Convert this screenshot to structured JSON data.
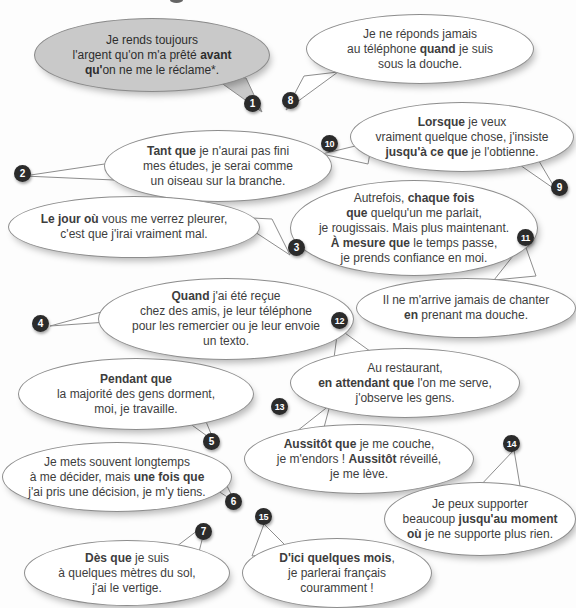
{
  "page": {
    "background_color": "#fdfdfd",
    "badge_color": "#2b2b2b",
    "bubble_fill": "#ffffff",
    "bubble_highlight_fill": "#c9c9c9",
    "bubble_stroke": "#8d8d8d"
  },
  "bubbles": [
    {
      "number": "1",
      "style": "gray",
      "lines": [
        [
          {
            "t": "Je rends toujours",
            "b": false
          }
        ],
        [
          {
            "t": "l'argent qu'on m'a prêté ",
            "b": false
          },
          {
            "t": "avant",
            "b": true
          }
        ],
        [
          {
            "t": "qu'",
            "b": true
          },
          {
            "t": "on ne me le réclame*.",
            "b": false
          }
        ]
      ]
    },
    {
      "number": "2",
      "style": "plain",
      "lines": [
        [
          {
            "t": "Tant que",
            "b": true
          },
          {
            "t": " je n'aurai pas fini",
            "b": false
          }
        ],
        [
          {
            "t": "mes études, je serai comme",
            "b": false
          }
        ],
        [
          {
            "t": "un oiseau sur la branche.",
            "b": false
          }
        ]
      ]
    },
    {
      "number": "3",
      "style": "plain",
      "lines": [
        [
          {
            "t": "Le jour où",
            "b": true
          },
          {
            "t": " vous me verrez pleurer,",
            "b": false
          }
        ],
        [
          {
            "t": "c'est que j'irai vraiment mal.",
            "b": false
          }
        ]
      ]
    },
    {
      "number": "4",
      "style": "plain",
      "lines": [
        [
          {
            "t": "Quand",
            "b": true
          },
          {
            "t": " j'ai été reçue",
            "b": false
          }
        ],
        [
          {
            "t": "chez des amis, je leur téléphone",
            "b": false
          }
        ],
        [
          {
            "t": "pour les remercier ou je leur envoie",
            "b": false
          }
        ],
        [
          {
            "t": "un texto.",
            "b": false
          }
        ]
      ]
    },
    {
      "number": "5",
      "style": "plain",
      "lines": [
        [
          {
            "t": "Pendant que",
            "b": true
          }
        ],
        [
          {
            "t": "la majorité des gens dorment,",
            "b": false
          }
        ],
        [
          {
            "t": "moi, je travaille.",
            "b": false
          }
        ]
      ]
    },
    {
      "number": "6",
      "style": "plain",
      "lines": [
        [
          {
            "t": "Je mets souvent longtemps",
            "b": false
          }
        ],
        [
          {
            "t": "à me décider, mais ",
            "b": false
          },
          {
            "t": "une fois que",
            "b": true
          }
        ],
        [
          {
            "t": "j'ai pris une décision, je m'y tiens.",
            "b": false
          }
        ]
      ]
    },
    {
      "number": "7",
      "style": "plain",
      "lines": [
        [
          {
            "t": "Dès que",
            "b": true
          },
          {
            "t": " je suis",
            "b": false
          }
        ],
        [
          {
            "t": "à quelques mètres du sol,",
            "b": false
          }
        ],
        [
          {
            "t": "j'ai le vertige.",
            "b": false
          }
        ]
      ]
    },
    {
      "number": "8",
      "style": "plain",
      "lines": [
        [
          {
            "t": "Je ne réponds jamais",
            "b": false
          }
        ],
        [
          {
            "t": "au téléphone ",
            "b": false
          },
          {
            "t": "quand",
            "b": true
          },
          {
            "t": " je suis",
            "b": false
          }
        ],
        [
          {
            "t": "sous la douche.",
            "b": false
          }
        ]
      ]
    },
    {
      "number": "9",
      "style": "plain",
      "lines": [
        [
          {
            "t": "Lorsque",
            "b": true
          },
          {
            "t": " je veux",
            "b": false
          }
        ],
        [
          {
            "t": "vraiment quelque chose, j'insiste",
            "b": false
          }
        ],
        [
          {
            "t": "jusqu'à ce que",
            "b": true
          },
          {
            "t": " je l'obtienne.",
            "b": false
          }
        ]
      ]
    },
    {
      "number": "10",
      "style": "plain",
      "lines": [
        [
          {
            "t": "Autrefois, ",
            "b": false
          },
          {
            "t": "chaque fois",
            "b": true
          }
        ],
        [
          {
            "t": "que",
            "b": true
          },
          {
            "t": " quelqu'un me parlait,",
            "b": false
          }
        ],
        [
          {
            "t": "je rougissais. Mais plus maintenant.",
            "b": false
          }
        ],
        [
          {
            "t": "À mesure que",
            "b": true
          },
          {
            "t": " le temps passe,",
            "b": false
          }
        ],
        [
          {
            "t": "je prends confiance en moi.",
            "b": false
          }
        ]
      ]
    },
    {
      "number": "11",
      "style": "plain",
      "lines": [
        [
          {
            "t": "Il ne m'arrive jamais de chanter",
            "b": false
          }
        ],
        [
          {
            "t": "en",
            "b": true
          },
          {
            "t": " prenant ma douche.",
            "b": false
          }
        ]
      ]
    },
    {
      "number": "12",
      "style": "plain",
      "lines": [
        [
          {
            "t": "Au restaurant,",
            "b": false
          }
        ],
        [
          {
            "t": "en attendant que",
            "b": true
          },
          {
            "t": " l'on me serve,",
            "b": false
          }
        ],
        [
          {
            "t": "j'observe les gens.",
            "b": false
          }
        ]
      ]
    },
    {
      "number": "13",
      "style": "plain",
      "lines": [
        [
          {
            "t": "Aussitôt que",
            "b": true
          },
          {
            "t": " je me couche,",
            "b": false
          }
        ],
        [
          {
            "t": "je m'endors ! ",
            "b": false
          },
          {
            "t": "Aussitôt",
            "b": true
          },
          {
            "t": " réveillé,",
            "b": false
          }
        ],
        [
          {
            "t": "je me lève.",
            "b": false
          }
        ]
      ]
    },
    {
      "number": "14",
      "style": "plain",
      "lines": [
        [
          {
            "t": "Je peux supporter",
            "b": false
          }
        ],
        [
          {
            "t": "beaucoup ",
            "b": false
          },
          {
            "t": "jusqu'au moment",
            "b": true
          }
        ],
        [
          {
            "t": "où",
            "b": true
          },
          {
            "t": " je ne supporte plus rien.",
            "b": false
          }
        ]
      ]
    },
    {
      "number": "15",
      "style": "plain",
      "lines": [
        [
          {
            "t": "D'ici quelques mois",
            "b": true
          },
          {
            "t": ",",
            "b": false
          }
        ],
        [
          {
            "t": "je parlerai français",
            "b": false
          }
        ],
        [
          {
            "t": "couramment !",
            "b": false
          }
        ]
      ]
    }
  ]
}
